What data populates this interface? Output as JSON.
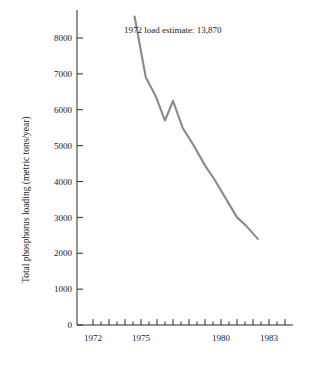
{
  "chart_data": {
    "type": "line",
    "title": "",
    "xlabel": "",
    "ylabel": "Total phosphorus loading (metric tons/year)",
    "xlim": [
      1971.0,
      1984.5
    ],
    "ylim": [
      0,
      8600
    ],
    "grid": false,
    "legend": "none",
    "x_ticks_major": [
      1972,
      1975,
      1980,
      1983
    ],
    "x_tick_labels": [
      "1972",
      "1975",
      "1980",
      "1983"
    ],
    "x_ticks_all": [
      1972,
      1972.5,
      1973,
      1973.5,
      1974,
      1974.5,
      1975,
      1975.5,
      1976,
      1976.5,
      1977,
      1977.5,
      1978,
      1978.5,
      1979,
      1979.5,
      1980,
      1980.5,
      1981,
      1981.5,
      1982,
      1982.5,
      1983,
      1983.5,
      1984
    ],
    "y_ticks": [
      0,
      1000,
      2000,
      3000,
      4000,
      5000,
      6000,
      7000,
      8000
    ],
    "y_tick_labels": [
      "0",
      "1000",
      "2000",
      "3000",
      "4000",
      "5000",
      "6000",
      "7000",
      "8000"
    ],
    "line_color": "#8a8a8a",
    "axis_color": "#2b2b2b",
    "series": [
      {
        "name": "Total phosphorus loading",
        "style": "solid",
        "x": [
          1974.6,
          1975.3,
          1975.9,
          1976.5,
          1977.0,
          1977.6,
          1978.3,
          1979.0,
          1979.6,
          1980.2,
          1981.0,
          1981.6,
          1982.3
        ],
        "values": [
          8600,
          6900,
          6400,
          5700,
          6250,
          5500,
          5000,
          4450,
          4050,
          3600,
          3000,
          2750,
          2400
        ]
      },
      {
        "name": "1972 extrapolated estimate",
        "style": "dashed",
        "x": [
          1972.0,
          1974.6
        ],
        "values": [
          13870,
          8600
        ]
      }
    ],
    "annotation": {
      "text": "1972 load estimate:  13,870",
      "x": 1975.3,
      "y": 8450
    }
  }
}
